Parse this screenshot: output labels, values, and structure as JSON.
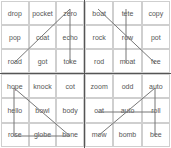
{
  "grids": [
    {
      "id": "top-left",
      "words": [
        "drop",
        "pocket",
        "zero",
        "pop",
        "coat",
        "echo",
        "road",
        "got",
        "toke"
      ]
    },
    {
      "id": "top-right",
      "words": [
        "boat",
        "tete",
        "copy",
        "rock",
        "row",
        "pot",
        "rod",
        "moat",
        "fee"
      ]
    },
    {
      "id": "bottom-left",
      "words": [
        "hope",
        "knock",
        "cot",
        "hello",
        "bowl",
        "body",
        "rose",
        "globe",
        "bone"
      ]
    },
    {
      "id": "bottom-right",
      "words": [
        "zoom",
        "odd",
        "auto",
        "oat",
        "auto",
        "roll",
        "mow",
        "bomb",
        "bee"
      ]
    }
  ],
  "colors": {
    "line": "#777777",
    "cell_border": "#cfcfcf",
    "divider": "#555555",
    "text": "#555555"
  }
}
